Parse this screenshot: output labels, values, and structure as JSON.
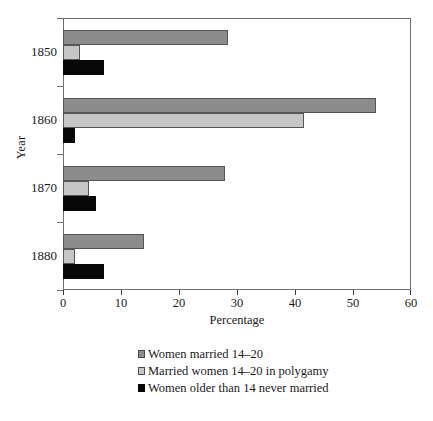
{
  "chart_data": {
    "type": "bar",
    "orientation": "horizontal",
    "title": "",
    "xlabel": "Percentage",
    "ylabel": "Year",
    "categories": [
      "1850",
      "1860",
      "1870",
      "1880"
    ],
    "xlim": [
      0,
      60
    ],
    "xticks": [
      0,
      10,
      20,
      30,
      40,
      50,
      60
    ],
    "xtick_labels": [
      "0",
      "10",
      "20",
      "30",
      "40",
      "50",
      "60"
    ],
    "grid": false,
    "legend_position": "bottom",
    "series": [
      {
        "name": "Women married 14–20",
        "color": "#8c8c8c",
        "values": [
          28.5,
          54.0,
          28.0,
          14.0
        ]
      },
      {
        "name": "Married women 14–20 in polygamy",
        "color": "#c6c6c6",
        "values": [
          3.0,
          41.5,
          4.5,
          2.0
        ]
      },
      {
        "name": "Women older than 14 never married",
        "color": "#080808",
        "values": [
          7.0,
          2.0,
          5.7,
          7.0
        ]
      }
    ]
  },
  "axes": {
    "x_title": "Percentage",
    "y_title": "Year",
    "x_tick_labels": [
      "0",
      "10",
      "20",
      "30",
      "40",
      "50",
      "60"
    ],
    "y_tick_labels": [
      "1850",
      "1860",
      "1870",
      "1880"
    ]
  },
  "legend": {
    "items": [
      {
        "label": "Women married 14–20",
        "swatch": "dark-gray-swatch"
      },
      {
        "label": "Married women 14–20 in polygamy",
        "swatch": "light-gray-swatch"
      },
      {
        "label": "Women older than 14 never married",
        "swatch": "black-swatch"
      }
    ]
  }
}
